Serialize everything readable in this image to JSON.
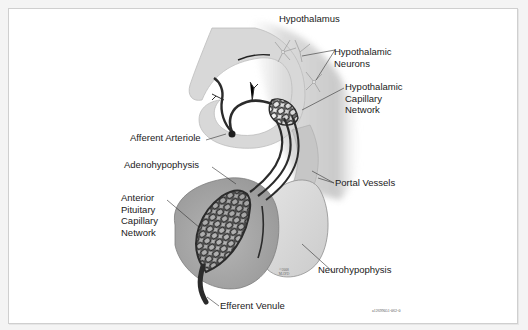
{
  "figure": {
    "labels": {
      "hypothalamus": "Hypothalamus",
      "hypothalamic_neurons": [
        "Hypothalamic",
        "Neurons"
      ],
      "hypothalamic_capillary_network": [
        "Hypothalamic",
        "Capillary",
        "Network"
      ],
      "afferent_arteriole": "Afferent Arteriole",
      "adenohypophysis": "Adenohypophysis",
      "anterior_pituitary_capillary_network": [
        "Anterior",
        "Pituitary",
        "Capillary",
        "Network"
      ],
      "portal_vessels": "Portal Vessels",
      "neurohypophysis": "Neurohypophysis",
      "efferent_venule": "Efferent Venule"
    },
    "copyright": [
      "©2008",
      "MAYO"
    ],
    "figure_code": "a12699051-062-0",
    "colors": {
      "background": "#ffffff",
      "frame_border": "#cfcfcf",
      "vessel": "#2b2b2b",
      "tissue_light": "#dcdcdc",
      "tissue_mid": "#b8b8b8",
      "adeno_fill": "#a9a9a9",
      "label_text": "#1a1a1a"
    }
  }
}
